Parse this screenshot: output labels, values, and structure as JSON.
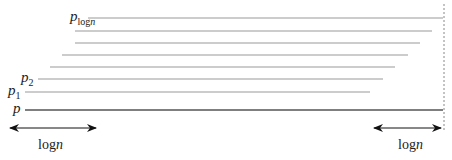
{
  "diagram": {
    "labels": {
      "top": {
        "base": "p",
        "sub": "log",
        "sub_italic": "n"
      },
      "p2": {
        "base": "p",
        "sub": "2"
      },
      "p1": {
        "base": "p",
        "sub": "1"
      },
      "p": {
        "base": "p"
      }
    },
    "left_span_label": {
      "text": "log",
      "italic": "n"
    },
    "right_span_label": {
      "text": "log",
      "italic": "n"
    },
    "colors": {
      "line": "#999999",
      "base_line": "#555555",
      "arrow": "#111111",
      "dashed": "#888888"
    }
  }
}
